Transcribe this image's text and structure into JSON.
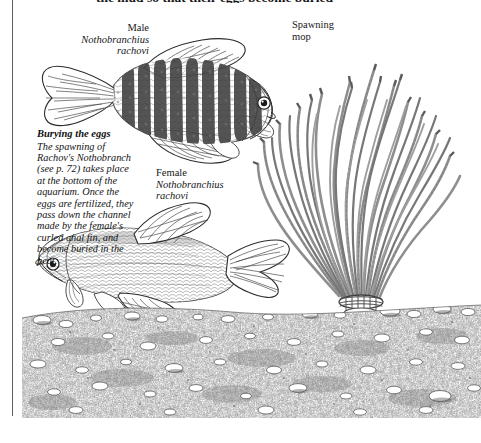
{
  "page": {
    "width": 481,
    "height": 443,
    "background": "#ffffff",
    "ink_color": "#141414",
    "rule_color": "#5d5d5d"
  },
  "running_text": {
    "cut_off_line": "the mud so that their eggs become buried"
  },
  "labels": {
    "male": {
      "common": "Male",
      "genus": "Nothobranchius",
      "species": "rachovi"
    },
    "female": {
      "common": "Female",
      "genus": "Nothobranchius",
      "species": "rachovi"
    },
    "spawning_mop": {
      "line1": "Spawning",
      "line2": "mop"
    }
  },
  "caption": {
    "title": "Burying the eggs",
    "body": "The spawning of Rachov's Nothobranch (see p. 72) takes place at the bottom of the aquarium. Once the eggs are fertilized, they pass down the channel made by the female's curled anal fin, and become buried in the peat."
  },
  "illustration": {
    "title": "Nothobranchius rachovi spawning in an aquarium",
    "elements": {
      "male_fish": "male-killifish-barred",
      "female_fish": "female-killifish-plain",
      "spawning_mop": "yarn-spawning-mop",
      "substrate": "peat-gravel-substrate"
    }
  }
}
